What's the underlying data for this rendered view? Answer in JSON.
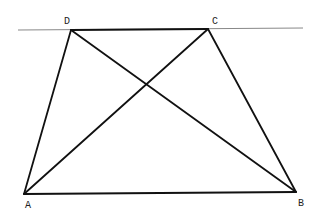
{
  "diagram": {
    "type": "geometry",
    "colors": {
      "line": "#888888",
      "edge": "#111111",
      "label": "#222222"
    },
    "parallel_line": {
      "x1": 18,
      "y1": 30,
      "x2": 303,
      "y2": 28
    },
    "points": {
      "A": {
        "x": 24,
        "y": 194
      },
      "B": {
        "x": 296,
        "y": 192
      },
      "C": {
        "x": 208,
        "y": 29
      },
      "D": {
        "x": 71,
        "y": 30
      }
    },
    "labels": [
      {
        "text": "D",
        "x": 64,
        "y": 24
      },
      {
        "text": "C",
        "x": 212,
        "y": 24
      },
      {
        "text": "A",
        "x": 25,
        "y": 208
      },
      {
        "text": "B",
        "x": 298,
        "y": 206
      }
    ],
    "segments": [
      [
        "A",
        "B"
      ],
      [
        "B",
        "C"
      ],
      [
        "C",
        "D"
      ],
      [
        "D",
        "A"
      ],
      [
        "A",
        "C"
      ],
      [
        "B",
        "D"
      ]
    ]
  }
}
